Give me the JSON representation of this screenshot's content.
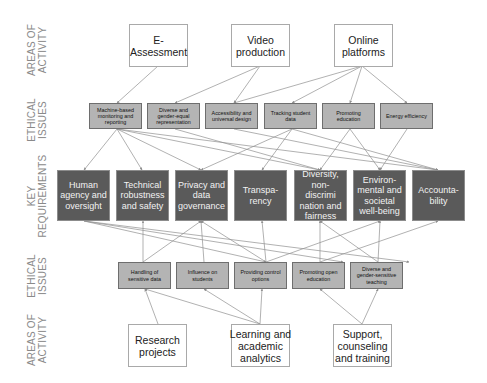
{
  "row_labels": {
    "top_areas": "AREAS OF\nACTIVITY",
    "top_issues": "ETHICAL\nISSUES",
    "requirements": "KEY\nREQUIREMENTS",
    "bottom_issues": "ETHICAL\nISSUES",
    "bottom_areas": "AREAS OF\nACTIVITY"
  },
  "top_areas": [
    {
      "label": "E-\nAssessment"
    },
    {
      "label": "Video\nproduction"
    },
    {
      "label": "Online\nplatforms"
    }
  ],
  "top_issues": [
    {
      "label": "Machine-based monitoring and reporting"
    },
    {
      "label": "Diverse and gender-equal representation"
    },
    {
      "label": "Accessibility and universal design"
    },
    {
      "label": "Tracking student data"
    },
    {
      "label": "Promoting education"
    },
    {
      "label": "Energy efficiency"
    }
  ],
  "requirements": [
    {
      "label": "Human agency and oversight"
    },
    {
      "label": "Technical robustness and safety"
    },
    {
      "label": "Privacy and data governance"
    },
    {
      "label": "Transpa-rency"
    },
    {
      "label": "Diversity, non-discrimi nation and fairness"
    },
    {
      "label": "Environ-mental and societal well-being"
    },
    {
      "label": "Accounta-bility"
    }
  ],
  "bottom_issues": [
    {
      "label": "Handling of sensitive data"
    },
    {
      "label": "Influence on students"
    },
    {
      "label": "Providing control options"
    },
    {
      "label": "Promoting open education"
    },
    {
      "label": "Diverse and gender-sensitive teaching"
    }
  ],
  "bottom_areas": [
    {
      "label": "Research\nprojects"
    },
    {
      "label": "Learning and\nacademic\nanalytics"
    },
    {
      "label": "Support,\ncounseling\nand training"
    }
  ],
  "colors": {
    "area_fill": "#ffffff",
    "issue_fill": "#b4b4b4",
    "requirement_fill": "#5a5a5a",
    "edge": "#8f8f8f",
    "label_text": "#8a8a8a"
  }
}
